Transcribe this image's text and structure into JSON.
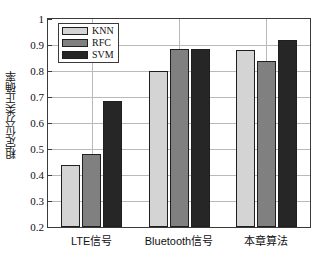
{
  "chart_data": {
    "type": "bar",
    "title": "",
    "xlabel": "",
    "ylabel": "粗定位分类正确率",
    "categories": [
      "LTE信号",
      "Bluetooth信号",
      "本章算法"
    ],
    "series": [
      {
        "name": "KNN",
        "values": [
          0.44,
          0.8,
          0.88
        ],
        "color": "#d4d4d4"
      },
      {
        "name": "RFC",
        "values": [
          0.48,
          0.885,
          0.84
        ],
        "color": "#808080"
      },
      {
        "name": "SVM",
        "values": [
          0.685,
          0.885,
          0.92
        ],
        "color": "#262626"
      }
    ],
    "ylim": [
      0.2,
      1.0
    ],
    "yticks": [
      "0.2",
      "0.3",
      "0.4",
      "0.5",
      "0.6",
      "0.7",
      "0.8",
      "0.9",
      "1"
    ],
    "grid": true,
    "legend_position": "top-left",
    "bar_edge_color": "#1f1f1f",
    "axis_color": "#3a3a3a",
    "grid_color": "#b9b9b9",
    "background": "#ffffff"
  },
  "legend": {
    "items": [
      {
        "label": "KNN"
      },
      {
        "label": "RFC"
      },
      {
        "label": "SVM"
      }
    ]
  }
}
